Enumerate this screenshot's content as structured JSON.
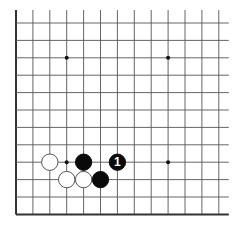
{
  "board": {
    "visible_columns": 13,
    "visible_rows": 12,
    "edges": {
      "left": true,
      "bottom": true,
      "top": false,
      "right": false
    },
    "line_color": "#555555",
    "edge_color": "#333333",
    "star_points": [
      {
        "col": 3,
        "row": 2
      },
      {
        "col": 9,
        "row": 2
      },
      {
        "col": 3,
        "row": 8
      },
      {
        "col": 9,
        "row": 8
      }
    ],
    "stones": [
      {
        "color": "white",
        "col": 2,
        "row": 8,
        "label": ""
      },
      {
        "color": "black",
        "col": 4,
        "row": 8,
        "label": ""
      },
      {
        "color": "black",
        "col": 6,
        "row": 8,
        "label": "1"
      },
      {
        "color": "white",
        "col": 3,
        "row": 9,
        "label": ""
      },
      {
        "color": "white",
        "col": 4,
        "row": 9,
        "label": ""
      },
      {
        "color": "black",
        "col": 5,
        "row": 9,
        "label": ""
      }
    ]
  },
  "caption": ""
}
